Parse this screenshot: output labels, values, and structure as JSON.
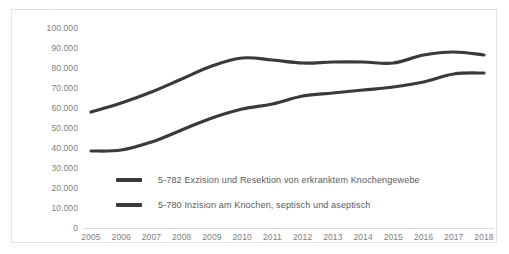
{
  "chart_data": {
    "type": "line",
    "title": "",
    "xlabel": "",
    "ylabel": "",
    "x": [
      2005,
      2006,
      2007,
      2008,
      2009,
      2010,
      2011,
      2012,
      2013,
      2014,
      2015,
      2016,
      2017,
      2018
    ],
    "categories": [
      "2005",
      "2006",
      "2007",
      "2008",
      "2009",
      "2010",
      "2011",
      "2012",
      "2013",
      "2014",
      "2015",
      "2016",
      "2017",
      "2018"
    ],
    "ylim": [
      0,
      100000
    ],
    "ytick_values": [
      0,
      10000,
      20000,
      30000,
      40000,
      50000,
      60000,
      70000,
      80000,
      90000,
      100000
    ],
    "ytick_labels": [
      "0",
      "10.000",
      "20.000",
      "30.000",
      "40.000",
      "50.000",
      "60.000",
      "70.000",
      "80.000",
      "90.000",
      "100.000"
    ],
    "grid": false,
    "legend_position": "inside-bottom-left",
    "series": [
      {
        "name": "5-782 Exzision und Resektion von erkranktem Knochengewebe",
        "color": "#3a3a3a",
        "values": [
          58000,
          62500,
          68000,
          74500,
          81000,
          85000,
          84000,
          82500,
          83000,
          83000,
          82500,
          86500,
          88000,
          86500
        ]
      },
      {
        "name": "5-780 Inzision am Knochen, septisch und aseptisch",
        "color": "#3a3a3a",
        "values": [
          38500,
          39000,
          43000,
          49000,
          55000,
          59500,
          62000,
          66000,
          67500,
          69000,
          70500,
          73000,
          77000,
          77500
        ]
      }
    ]
  },
  "legend": {
    "items": [
      {
        "label": "5-782 Exzision und Resektion von erkranktem Knochengewebe",
        "color": "#3a3a3a"
      },
      {
        "label": "5-780 Inzision am Knochen, septisch und aseptisch",
        "color": "#3a3a3a"
      }
    ]
  },
  "colors": {
    "frame_border": "#e3e3e3",
    "axis_line": "#d9d9d9",
    "tick_text": "#808080",
    "legend_text": "#5a5a5a",
    "series_line": "#3a3a3a",
    "background": "#ffffff"
  }
}
